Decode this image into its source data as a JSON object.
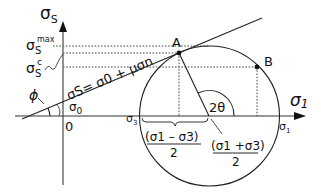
{
  "diagram": {
    "type": "mohr-circle",
    "axes": {
      "y_label": "σ",
      "y_label_sub": "S",
      "x_label": "σ",
      "x_label_sub": "1",
      "origin_label": "0"
    },
    "y_ticks": {
      "max_main": "σ",
      "max_sub": "S",
      "max_sup": "max",
      "c_main": "σ",
      "c_sub": "S",
      "c_sup": "c"
    },
    "x_ticks": {
      "sigma3_main": "σ",
      "sigma3_sub": "3",
      "sigma1_main": "σ",
      "sigma1_sub": "1"
    },
    "failure_line": {
      "equation": "σS= σ0 + μσn",
      "intercept_label": "σ",
      "intercept_sub": "0",
      "angle_label": "ϕ"
    },
    "points": {
      "A": "A",
      "B": "B"
    },
    "angle_label": "2θ",
    "radius_label": {
      "numerator": "(σ1 – σ3)",
      "denominator": "2"
    },
    "center_label": {
      "numerator": "(σ1 +σ3)",
      "denominator": "2"
    },
    "colors": {
      "axis": "#777777",
      "line": "#222222",
      "text": "#111111"
    }
  }
}
